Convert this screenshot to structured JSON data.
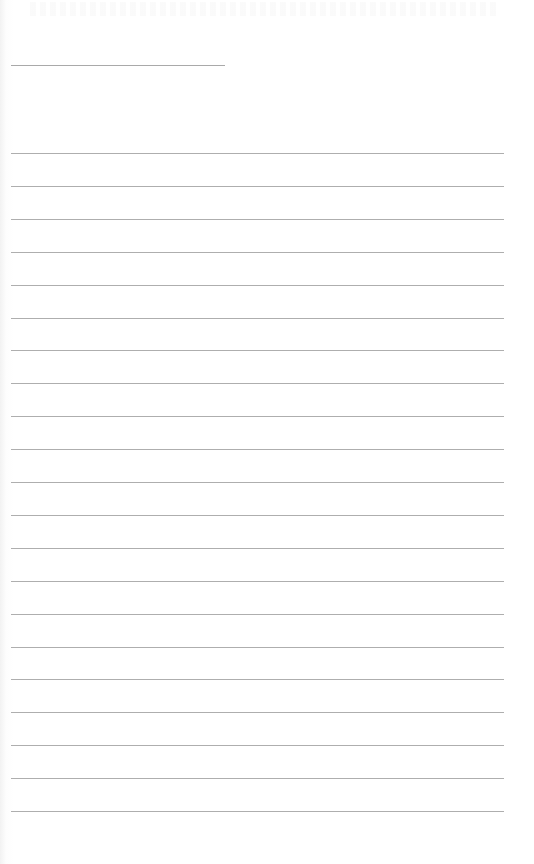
{
  "page": {
    "type": "lined-paper",
    "background_color": "#ffffff",
    "line_color": "#aeaeae"
  },
  "header_line": {
    "top": 65,
    "left": 11,
    "width": 214
  },
  "rules": {
    "left": 11,
    "width": 493,
    "first_top": 153,
    "spacing": 32.9,
    "count": 21
  }
}
